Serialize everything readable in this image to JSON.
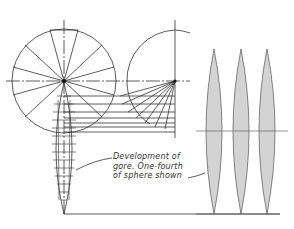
{
  "figure": {
    "caption_lines": [
      "Development of",
      "gore. One-fourth",
      "of sphere shown"
    ],
    "colors": {
      "line": "#333333",
      "gore_fill": "#d3d3d3",
      "background": "#ffffff"
    },
    "gores": [
      {
        "cx": 214
      },
      {
        "cx": 241
      },
      {
        "cx": 267
      }
    ]
  }
}
